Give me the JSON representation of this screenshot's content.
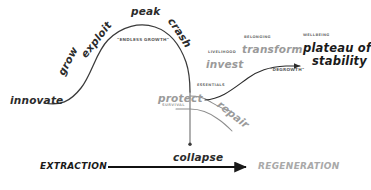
{
  "diagram": {
    "colors": {
      "curve": "#3a3a3a",
      "branch": "#8d8d8d",
      "ink": "#2b2b2b",
      "muted": "#9a9a9a",
      "caption": "#6f6f6f",
      "caption_light": "#a8a8a8",
      "axis": "#111111",
      "axis_muted": "#a9a9a9",
      "background": "#ffffff"
    }
  },
  "stages": {
    "innovate": "innovate",
    "grow": "grow",
    "exploit": "exploit",
    "peak": "peak",
    "crash": "crash",
    "collapse": "collapse",
    "protect": "protect",
    "invest": "invest",
    "repair": "repair",
    "transform": "transform",
    "plateau": "plateau of\nstability",
    "plateau_line1": "plateau of",
    "plateau_line2": "stability"
  },
  "captions": {
    "protect_sub": "SURVIVAL",
    "invest_sub": "LIVELIHOOD",
    "repair_sub": "ESSENTIALS",
    "transform_sub": "BELONGING",
    "plateau_sub": "WELLBEING"
  },
  "slogans": {
    "endless_growth": "\"ENDLESS GROWTH\"",
    "degrowth": "\"DEGROWTH\""
  },
  "axis": {
    "left_label": "EXTRACTION",
    "right_label": "REGENERATION"
  }
}
